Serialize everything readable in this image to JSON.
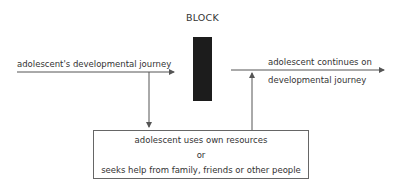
{
  "diagram": {
    "title": "BLOCK",
    "left_arrow_label": "adolescent's developmental journey",
    "right_arrow_label_line1": "adolescent continues on",
    "right_arrow_label_line2": "developmental journey",
    "box": {
      "line1": "adolescent uses own resources",
      "line2": "or",
      "line3": "seeks help from family, friends or other people"
    },
    "colors": {
      "block": "#1c1c1c",
      "lines": "#555555",
      "text": "#333333"
    }
  }
}
